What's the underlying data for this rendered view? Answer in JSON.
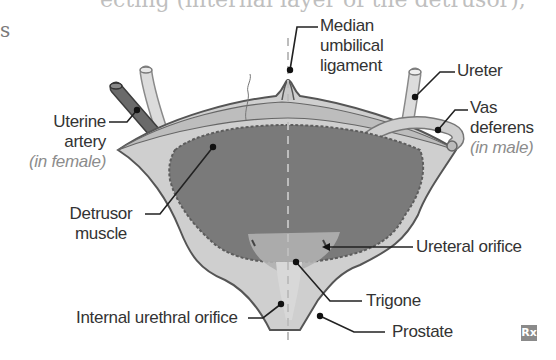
{
  "header": {
    "partial_text_top": "ecting (internal layer of the detrusor),",
    "partial_text_left": "s"
  },
  "diagram": {
    "labels": {
      "median_umbilical_ligament": [
        "Median",
        "umbilical",
        "ligament"
      ],
      "ureter": "Ureter",
      "vas_deferens": [
        "Vas",
        "deferens"
      ],
      "vas_deferens_note": "(in male)",
      "uterine_artery": [
        "Uterine",
        "artery"
      ],
      "uterine_artery_note": "(in female)",
      "detrusor_muscle": [
        "Detrusor",
        "muscle"
      ],
      "ureteral_orifice": "Ureteral orifice",
      "trigone": "Trigone",
      "internal_urethral_orifice": "Internal urethral orifice",
      "prostate": "Prostate"
    },
    "logo": "Rx",
    "colors": {
      "outer_wall": "#c9c9c9",
      "mucosa": "#7f7f7f",
      "trigone": "#b3b3b3",
      "outline": "#555555",
      "leader": "#222222",
      "midline": "#bdbdbd"
    }
  }
}
